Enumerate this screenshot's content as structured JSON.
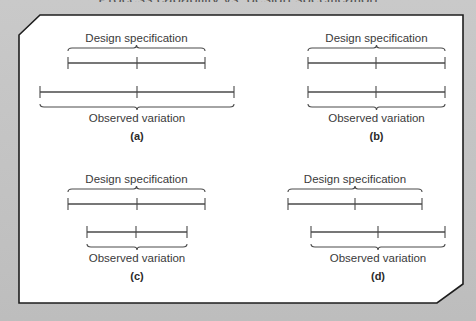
{
  "top_caption": "Process capability vs. design specification",
  "colors": {
    "background": "#c4c4c4",
    "frame_fill": "#ffffff",
    "frame_border": "#1e1e1e",
    "line": "#4a4a4a",
    "text": "#3a3a3a"
  },
  "panels": [
    {
      "id": "a",
      "letter": "(a)",
      "design_label": "Design specification",
      "observed_label": "Observed variation",
      "design": {
        "x1": 68,
        "x2": 205,
        "mid": 137,
        "y": 63
      },
      "observed": {
        "x1": 40,
        "x2": 234,
        "mid": 137,
        "y": 92
      }
    },
    {
      "id": "b",
      "letter": "(b)",
      "design_label": "Design specification",
      "observed_label": "Observed variation",
      "design": {
        "x1": 308,
        "x2": 445,
        "mid": 376,
        "y": 63
      },
      "observed": {
        "x1": 308,
        "x2": 445,
        "mid": 376,
        "y": 92
      }
    },
    {
      "id": "c",
      "letter": "(c)",
      "design_label": "Design specification",
      "observed_label": "Observed variation",
      "design": {
        "x1": 68,
        "x2": 205,
        "mid": 137,
        "y": 204
      },
      "observed": {
        "x1": 87,
        "x2": 187,
        "mid": 136,
        "y": 232
      }
    },
    {
      "id": "d",
      "letter": "(d)",
      "design_label": "Design specification",
      "observed_label": "Observed variation",
      "design": {
        "x1": 288,
        "x2": 422,
        "mid": 355,
        "y": 204
      },
      "observed": {
        "x1": 311,
        "x2": 445,
        "mid": 378,
        "y": 232
      }
    }
  ]
}
